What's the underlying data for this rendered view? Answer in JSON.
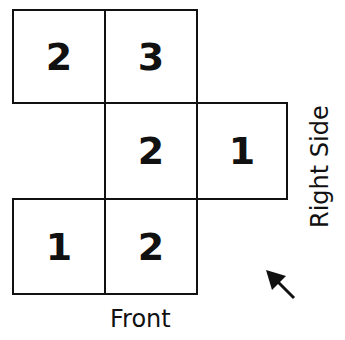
{
  "grid": {
    "cells": [
      {
        "id": "r1c1",
        "value": "2",
        "x": 12,
        "y": 9
      },
      {
        "id": "r1c2",
        "value": "3",
        "x": 104,
        "y": 9
      },
      {
        "id": "r2c2",
        "value": "2",
        "x": 104,
        "y": 102
      },
      {
        "id": "r2c3",
        "value": "1",
        "x": 196,
        "y": 102
      },
      {
        "id": "r3c1",
        "value": "1",
        "x": 12,
        "y": 198
      },
      {
        "id": "r3c2",
        "value": "2",
        "x": 104,
        "y": 198
      }
    ]
  },
  "labels": {
    "front": "Front",
    "right_side": "Right Side"
  },
  "icons": {
    "arrow": "arrow-up-left-icon"
  }
}
